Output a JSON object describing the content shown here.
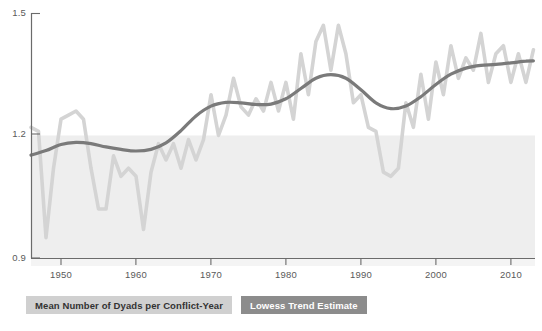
{
  "chart_data": {
    "type": "line",
    "title": "",
    "xlabel": "",
    "ylabel": "",
    "xlim": [
      1946,
      2013
    ],
    "ylim": [
      0.9,
      1.5
    ],
    "grid": false,
    "legend_position": "below-plot-left",
    "y_ticks": [
      "1.5",
      "1.2",
      "0.9"
    ],
    "y_tick_values": [
      1.5,
      1.2,
      0.9
    ],
    "x_ticks": [
      "1950",
      "1960",
      "1970",
      "1980",
      "1990",
      "2000",
      "2010"
    ],
    "x_tick_values": [
      1950,
      1960,
      1970,
      1980,
      1990,
      2000,
      2010
    ],
    "shaded_band": {
      "from": 0.9,
      "to": 1.2,
      "color": "#eeeeee"
    },
    "series": [
      {
        "name": "Mean Number of Dyads per Conflict-Year",
        "color": "#d4d4d4",
        "style": "jagged-annual",
        "x": [
          1946,
          1947,
          1948,
          1949,
          1950,
          1951,
          1952,
          1953,
          1954,
          1955,
          1956,
          1957,
          1958,
          1959,
          1960,
          1961,
          1962,
          1963,
          1964,
          1965,
          1966,
          1967,
          1968,
          1969,
          1970,
          1971,
          1972,
          1973,
          1974,
          1975,
          1976,
          1977,
          1978,
          1979,
          1980,
          1981,
          1982,
          1983,
          1984,
          1985,
          1986,
          1987,
          1988,
          1989,
          1990,
          1991,
          1992,
          1993,
          1994,
          1995,
          1996,
          1997,
          1998,
          1999,
          2000,
          2001,
          2002,
          2003,
          2004,
          2005,
          2006,
          2007,
          2008,
          2009,
          2010,
          2011,
          2012,
          2013
        ],
        "values": [
          1.22,
          1.21,
          0.95,
          1.12,
          1.24,
          1.25,
          1.26,
          1.24,
          1.12,
          1.02,
          1.02,
          1.15,
          1.1,
          1.12,
          1.1,
          0.97,
          1.11,
          1.18,
          1.14,
          1.18,
          1.12,
          1.19,
          1.14,
          1.19,
          1.3,
          1.2,
          1.25,
          1.34,
          1.27,
          1.25,
          1.29,
          1.26,
          1.33,
          1.26,
          1.33,
          1.24,
          1.4,
          1.3,
          1.43,
          1.47,
          1.36,
          1.47,
          1.4,
          1.28,
          1.3,
          1.22,
          1.21,
          1.11,
          1.1,
          1.12,
          1.28,
          1.22,
          1.35,
          1.24,
          1.38,
          1.3,
          1.42,
          1.34,
          1.39,
          1.36,
          1.45,
          1.33,
          1.4,
          1.42,
          1.33,
          1.4,
          1.33,
          1.41
        ]
      },
      {
        "name": "Lowess Trend Estimate",
        "color": "#7a7a7a",
        "style": "smooth-lowess",
        "x": [
          1946,
          1948,
          1950,
          1952,
          1954,
          1956,
          1958,
          1960,
          1962,
          1964,
          1966,
          1968,
          1970,
          1972,
          1974,
          1976,
          1978,
          1980,
          1982,
          1984,
          1986,
          1988,
          1990,
          1992,
          1994,
          1996,
          1998,
          2000,
          2002,
          2004,
          2006,
          2008,
          2010,
          2012,
          2013
        ],
        "values": [
          1.152,
          1.163,
          1.178,
          1.183,
          1.18,
          1.172,
          1.166,
          1.162,
          1.166,
          1.182,
          1.212,
          1.248,
          1.272,
          1.281,
          1.28,
          1.276,
          1.277,
          1.29,
          1.315,
          1.34,
          1.349,
          1.34,
          1.312,
          1.28,
          1.266,
          1.272,
          1.295,
          1.325,
          1.35,
          1.365,
          1.372,
          1.374,
          1.378,
          1.382,
          1.383
        ]
      }
    ]
  },
  "legend": {
    "items": [
      {
        "label": "Mean Number of Dyads per Conflict-Year",
        "swatch": "#d0d0d0",
        "text_color": "#333333"
      },
      {
        "label": "Lowess Trend Estimate",
        "swatch": "#8c8c8c",
        "text_color": "#ffffff"
      }
    ]
  },
  "axis": {
    "line_color": "#6b6b6b",
    "tick_label_color": "#5a5a5a"
  },
  "caption": {
    "text": ""
  }
}
